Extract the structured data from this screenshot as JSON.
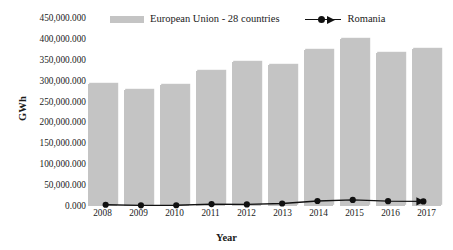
{
  "chart_data": {
    "type": "bar",
    "title": "",
    "xlabel": "Year",
    "ylabel": "GWh",
    "categories": [
      "2008",
      "2009",
      "2010",
      "2011",
      "2012",
      "2013",
      "2014",
      "2015",
      "2016",
      "2017"
    ],
    "ylim": [
      0,
      450000.0
    ],
    "ytick_labels": [
      "450,000.000",
      "400,000.000",
      "350,000.000",
      "300,000.000",
      "250,000.000",
      "200,000.000",
      "150,000.000",
      "100,000.000",
      "50,000.000",
      "0.000"
    ],
    "ytick_values": [
      450000,
      400000,
      350000,
      300000,
      250000,
      200000,
      150000,
      100000,
      50000,
      0
    ],
    "grid": false,
    "legend_position": "top",
    "series": [
      {
        "name": "European Union - 28 countries",
        "type": "bar",
        "color": "#c4c4c4",
        "values": [
          293000,
          278000,
          290000,
          322000,
          345000,
          338000,
          374000,
          399000,
          366000,
          377000
        ]
      },
      {
        "name": "Romania",
        "type": "line",
        "color": "#111111",
        "marker": "circle",
        "values": [
          3000,
          1500,
          1800,
          4500,
          3800,
          6000,
          12000,
          14500,
          11500,
          11000
        ]
      }
    ]
  },
  "legend": {
    "eu_label": "European Union - 28 countries",
    "romania_label": "Romania"
  },
  "axes": {
    "y_title": "GWh",
    "x_title": "Year"
  }
}
